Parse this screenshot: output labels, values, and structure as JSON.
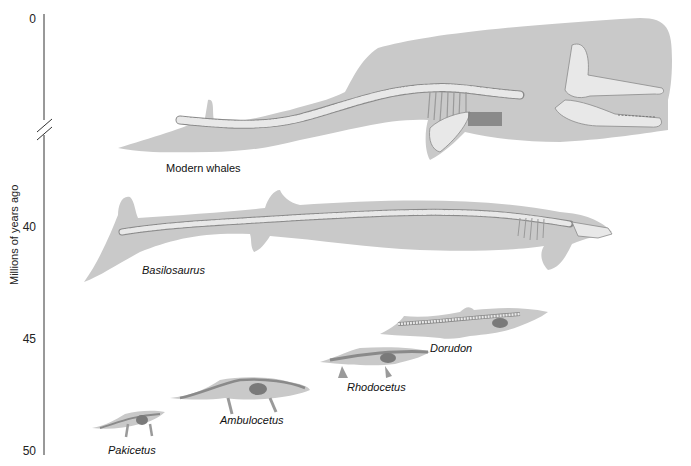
{
  "axis": {
    "title": "Millions of years ago",
    "ticks": [
      "0",
      "40",
      "45",
      "50"
    ],
    "break_marker": "axis-break"
  },
  "species": [
    {
      "name": "Modern whales",
      "italic": false
    },
    {
      "name": "Basilosaurus",
      "italic": true
    },
    {
      "name": "Dorudon",
      "italic": true
    },
    {
      "name": "Rhodocetus",
      "italic": true
    },
    {
      "name": "Ambulocetus",
      "italic": true
    },
    {
      "name": "Pakicetus",
      "italic": true
    }
  ],
  "colors": {
    "body": "#c9c9c9",
    "bone": "#e8e8e8",
    "bone_outline": "#8a8a8a",
    "organ": "#7a7a7a",
    "axis": "#333333"
  }
}
